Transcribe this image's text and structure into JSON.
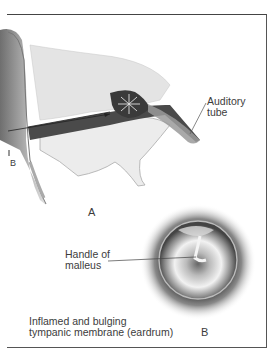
{
  "figure": {
    "panel_a": {
      "label": "A",
      "callouts": [
        {
          "id": "auditory-tube",
          "lines": [
            "Auditory",
            "tube"
          ]
        }
      ],
      "edge_marker": "B"
    },
    "panel_b": {
      "label": "B",
      "callouts": [
        {
          "id": "handle-of-malleus",
          "lines": [
            "Handle of",
            "malleus"
          ]
        }
      ],
      "caption_lines": [
        "Inflamed and bulging",
        "tympanic membrane (eardrum)"
      ]
    }
  }
}
